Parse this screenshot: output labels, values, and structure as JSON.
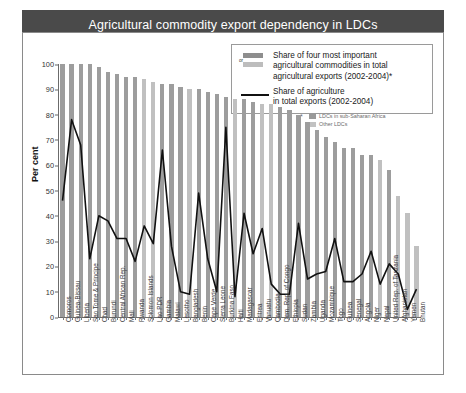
{
  "header": {
    "title": "Agricultural commodity export dependency in LDCs",
    "globe_icon": "world-map-globe-icon"
  },
  "legend": {
    "or_label": "or",
    "bars_label": "Share of four most important agricultural commodities in total agricultural exports (2002-2004)*",
    "bars_label_line1": "Share of four most important",
    "bars_label_line2": "agricultural commodities in total",
    "bars_label_line3": "agricultural exports (2002-2004)*",
    "line_label_line1": "Share of agriculture",
    "line_label_line2": "in total exports (2002-2004)",
    "colors": {
      "bar_ssa": "#9d9d9d",
      "bar_other": "#c0c0c0",
      "line": "#111111"
    }
  },
  "sublegend": {
    "star": "*",
    "items": [
      {
        "label": "LDCs in sub-Saharan Africa",
        "color": "#9a9a9a"
      },
      {
        "label": "Other LDCs",
        "color": "#c2c2c2"
      }
    ]
  },
  "chart_data": {
    "type": "bar",
    "title": "Agricultural commodity export dependency in LDCs",
    "xlabel": "",
    "ylabel": "Per cent",
    "ylim": [
      0,
      100
    ],
    "yticks": [
      0,
      10,
      20,
      30,
      40,
      50,
      60,
      70,
      80,
      90,
      100
    ],
    "grid": false,
    "legend_position": "top-right",
    "categories": [
      "Comoros",
      "Guinea-Bissau",
      "Liberia",
      "Sao Tome & Principe",
      "Chad",
      "Burundi",
      "Central African Rep.",
      "Mali",
      "Rwanda",
      "Solomon Islands",
      "Lao PDR",
      "Gambia",
      "Malawi",
      "Lesotho",
      "Bangladesh",
      "Benin",
      "Cape Verde",
      "Sierra Leone",
      "Burkina Faso",
      "Haiti",
      "Madagascar",
      "Eritrea",
      "Vanuatu",
      "Cambodia",
      "Dem. Rep. of Congo",
      "Ethiopia",
      "Sudan",
      "Zambia",
      "Uganda",
      "Mozambique",
      "Togo",
      "Guinea",
      "Senegal",
      "Angola",
      "Niger",
      "Nepal",
      "United Rep. of Tanzania",
      "Afghanistan",
      "Yemen",
      "Bhutan"
    ],
    "group": [
      "ssa",
      "ssa",
      "ssa",
      "ssa",
      "ssa",
      "ssa",
      "ssa",
      "ssa",
      "ssa",
      "other",
      "other",
      "ssa",
      "ssa",
      "ssa",
      "other",
      "ssa",
      "ssa",
      "ssa",
      "ssa",
      "other",
      "ssa",
      "ssa",
      "other",
      "other",
      "ssa",
      "ssa",
      "ssa",
      "ssa",
      "ssa",
      "ssa",
      "ssa",
      "ssa",
      "ssa",
      "ssa",
      "ssa",
      "other",
      "ssa",
      "other",
      "other",
      "other"
    ],
    "series": [
      {
        "name": "Share of four most important agricultural commodities in total agricultural exports (2002-2004)",
        "type": "bar",
        "values": [
          100,
          100,
          100,
          100,
          99,
          97,
          96,
          95,
          95,
          94,
          93,
          92,
          92,
          91,
          90,
          90,
          89,
          88,
          87,
          86,
          86,
          85,
          84,
          84,
          83,
          82,
          80,
          77,
          74,
          71,
          69,
          67,
          67,
          64,
          64,
          62,
          58,
          48,
          41,
          28
        ]
      },
      {
        "name": "Share of agriculture in total exports (2002-2004)",
        "type": "line",
        "values": [
          46,
          78,
          68,
          23,
          40,
          38,
          31,
          31,
          22,
          36,
          29,
          66,
          28,
          10,
          9,
          49,
          23,
          10,
          75,
          8,
          41,
          25,
          35,
          13,
          9,
          9,
          37,
          15,
          17,
          18,
          31,
          14,
          14,
          17,
          26,
          13,
          21,
          17,
          3,
          11
        ]
      }
    ]
  }
}
